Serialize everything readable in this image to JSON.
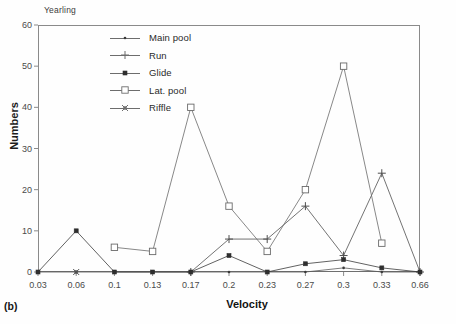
{
  "figure": {
    "panel_tag": "(b)",
    "panel_title": "Yearling"
  },
  "chart_data": {
    "type": "line",
    "title": "Yearling",
    "xlabel": "Velocity",
    "ylabel": "Numbers",
    "x": [
      0.03,
      0.06,
      0.1,
      0.13,
      0.17,
      0.2,
      0.23,
      0.27,
      0.3,
      0.33,
      0.66
    ],
    "xtick_labels": [
      "0.03",
      "0.06",
      "0.1",
      "0.13",
      "0.17",
      "0.2",
      "0.23",
      "0.27",
      "0.3",
      "0.33",
      "0.66"
    ],
    "ytick_labels": [
      "0",
      "10",
      "20",
      "30",
      "40",
      "50",
      "60"
    ],
    "yticks": [
      0,
      10,
      20,
      30,
      40,
      50,
      60
    ],
    "ylim": [
      0,
      60
    ],
    "grid": false,
    "legend_position": "top-center-inside",
    "series": [
      {
        "name": "Main pool",
        "marker": "dot",
        "color": "#5a5a5a",
        "x": [
          0.03,
          0.06,
          0.1,
          0.13,
          0.17,
          0.2,
          0.23,
          0.27,
          0.3,
          0.33,
          0.66
        ],
        "values": [
          0,
          0,
          0,
          0,
          0,
          0,
          0,
          0,
          1,
          0,
          0
        ]
      },
      {
        "name": "Run",
        "marker": "plus",
        "color": "#4f4f4f",
        "x": [
          0.17,
          0.2,
          0.23,
          0.27,
          0.3,
          0.33,
          0.66
        ],
        "values": [
          0,
          8,
          8,
          16,
          4,
          24,
          0
        ]
      },
      {
        "name": "Glide",
        "marker": "filled-square",
        "color": "#3a3a3a",
        "x": [
          0.03,
          0.06,
          0.1,
          0.13,
          0.17,
          0.2,
          0.23,
          0.27,
          0.3,
          0.33,
          0.66
        ],
        "values": [
          0,
          10,
          0,
          0,
          0,
          4,
          0,
          2,
          3,
          1,
          0
        ]
      },
      {
        "name": "Lat. pool",
        "marker": "open-square",
        "color": "#6a6a6a",
        "x": [
          0.1,
          0.13,
          0.17,
          0.2,
          0.23,
          0.27,
          0.3,
          0.33
        ],
        "values": [
          6,
          5,
          40,
          16,
          5,
          20,
          50,
          7
        ]
      },
      {
        "name": "Riffle",
        "marker": "x-cross",
        "color": "#555555",
        "x": [
          0.06
        ],
        "values": [
          0
        ]
      }
    ]
  },
  "legend": {
    "items": [
      {
        "label": "Main pool",
        "marker": "dot"
      },
      {
        "label": "Run",
        "marker": "plus"
      },
      {
        "label": "Glide",
        "marker": "filled-square"
      },
      {
        "label": "Lat. pool",
        "marker": "open-square"
      },
      {
        "label": "Riffle",
        "marker": "x-cross"
      }
    ]
  },
  "axes": {
    "y_axis_title": "Numbers",
    "x_axis_title": "Velocity"
  }
}
